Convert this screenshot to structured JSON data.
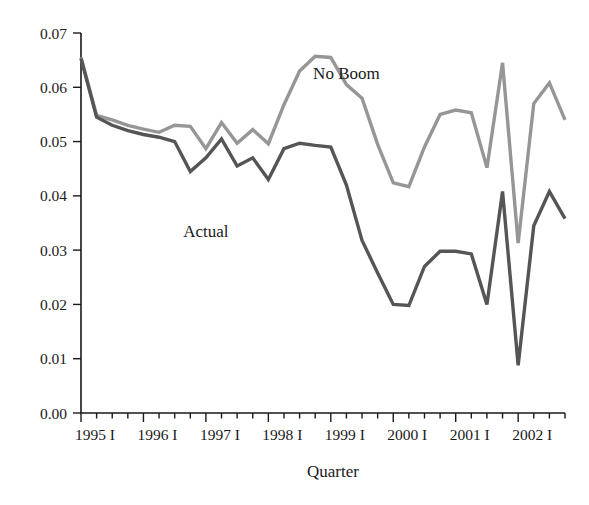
{
  "chart_data": {
    "type": "line",
    "title": "",
    "xlabel": "Quarter",
    "ylabel": "",
    "ylim": [
      0.0,
      0.07
    ],
    "ytick_values": [
      0.0,
      0.01,
      0.02,
      0.03,
      0.04,
      0.05,
      0.06,
      0.07
    ],
    "ytick_labels": [
      "0.00",
      "0.01",
      "0.02",
      "0.03",
      "0.04",
      "0.05",
      "0.06",
      "0.07"
    ],
    "xtick_labels": [
      "1995 I",
      "1996 I",
      "1997 I",
      "1998 I",
      "1999 I",
      "2000 I",
      "2001 I",
      "2002 I"
    ],
    "xtick_quarter_index": [
      0,
      4,
      8,
      12,
      16,
      20,
      24,
      28
    ],
    "minor_ticks_per_year": 4,
    "grid": false,
    "legend_position": "inline-annotation",
    "x": [
      "1995 I",
      "1995 II",
      "1995 III",
      "1995 IV",
      "1996 I",
      "1996 II",
      "1996 III",
      "1996 IV",
      "1997 I",
      "1997 II",
      "1997 III",
      "1997 IV",
      "1998 I",
      "1998 II",
      "1998 III",
      "1998 IV",
      "1999 I",
      "1999 II",
      "1999 III",
      "1999 IV",
      "2000 I",
      "2000 II",
      "2000 III",
      "2000 IV",
      "2001 I",
      "2001 II",
      "2001 III",
      "2001 IV",
      "2002 I",
      "2002 II",
      "2002 III",
      "2002 IV"
    ],
    "series": [
      {
        "name": "No Boom",
        "color": "#969696",
        "label_x_index": 17.0,
        "label_y_value": 0.0615,
        "values": [
          0.0655,
          0.0548,
          0.054,
          0.053,
          0.0523,
          0.0517,
          0.053,
          0.0528,
          0.0487,
          0.0535,
          0.0497,
          0.0522,
          0.0496,
          0.0568,
          0.063,
          0.0657,
          0.0655,
          0.0605,
          0.058,
          0.0495,
          0.0424,
          0.0417,
          0.049,
          0.055,
          0.0558,
          0.0553,
          0.0452,
          0.0645,
          0.0313,
          0.057,
          0.0608,
          0.054
        ]
      },
      {
        "name": "Actual",
        "color": "#555555",
        "label_x_index": 8.0,
        "label_y_value": 0.0325,
        "values": [
          0.0653,
          0.0545,
          0.053,
          0.052,
          0.0513,
          0.0508,
          0.05,
          0.0445,
          0.047,
          0.0505,
          0.0455,
          0.047,
          0.043,
          0.0487,
          0.0497,
          0.0493,
          0.049,
          0.042,
          0.0318,
          0.0258,
          0.02,
          0.0198,
          0.027,
          0.0298,
          0.0298,
          0.0293,
          0.02,
          0.0408,
          0.0088,
          0.0345,
          0.0408,
          0.0358
        ]
      }
    ]
  },
  "geometry": {
    "plot_left_px": 81,
    "plot_right_px": 565,
    "plot_top_px": 33,
    "plot_bottom_px": 413
  },
  "axis": {
    "x_title": "Quarter"
  }
}
